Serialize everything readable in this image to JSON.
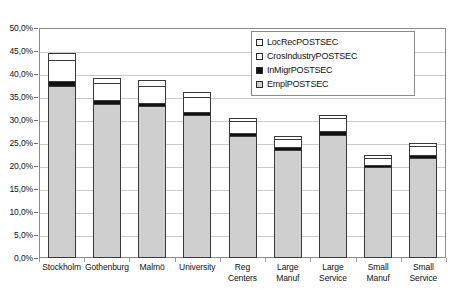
{
  "chart_data": {
    "type": "bar",
    "title": "",
    "subtitle": "",
    "xlabel": "",
    "ylabel": "",
    "stacked": true,
    "grid": true,
    "legend_position": "top-right",
    "ylim": [
      0,
      50
    ],
    "ytick_labels": [
      "50,0%",
      "45,0%",
      "40,0%",
      "35,0%",
      "30,0%",
      "25,0%",
      "20,0%",
      "15,0%",
      "10,0%",
      "5,0%",
      "0,0%"
    ],
    "ytick_values": [
      50,
      45,
      40,
      35,
      30,
      25,
      20,
      15,
      10,
      5,
      0
    ],
    "categories": [
      "Stockholm",
      "Gothenburg",
      "Malmö",
      "University",
      "Reg Centers",
      "Large Manuf",
      "Large Service",
      "Small Manuf",
      "Small Service"
    ],
    "series": [
      {
        "name": "EmplPOSTSEC",
        "color": "#cfcfcf",
        "values": [
          37.5,
          33.5,
          33.0,
          31.0,
          26.5,
          23.5,
          26.8,
          19.7,
          21.8
        ]
      },
      {
        "name": "InMigrPOSTSEC",
        "color": "#111111",
        "values": [
          1.0,
          0.8,
          0.7,
          0.8,
          0.7,
          0.6,
          0.8,
          0.5,
          0.6
        ]
      },
      {
        "name": "CrosIndustryPOSTSEC",
        "color": "#ffffff",
        "values": [
          4.5,
          3.7,
          3.8,
          3.2,
          2.5,
          1.8,
          2.8,
          1.6,
          2.0
        ]
      },
      {
        "name": "LocRecPOSTSEC",
        "color": "#ffffff",
        "values": [
          1.5,
          1.2,
          1.2,
          1.0,
          0.8,
          0.6,
          0.8,
          0.5,
          0.6
        ]
      }
    ],
    "totals": [
      44.5,
      39.2,
      38.7,
      36.0,
      30.5,
      26.5,
      31.2,
      22.3,
      25.0
    ]
  },
  "legend": {
    "items": [
      {
        "label": "LocRecPOSTSEC",
        "swatch": "white-square-icon"
      },
      {
        "label": "CrosIndustryPOSTSEC",
        "swatch": "white-square-icon"
      },
      {
        "label": "InMigrPOSTSEC",
        "swatch": "black-square-icon"
      },
      {
        "label": "EmplPOSTSEC",
        "swatch": "speckled-square-icon"
      }
    ]
  },
  "axis": {
    "y_labels": [
      "50,0%",
      "45,0%",
      "40,0%",
      "35,0%",
      "30,0%",
      "25,0%",
      "20,0%",
      "15,0%",
      "10,0%",
      "5,0%",
      "0,0%"
    ],
    "x_labels": [
      {
        "line1": "Stockholm",
        "line2": ""
      },
      {
        "line1": "Gothenburg",
        "line2": ""
      },
      {
        "line1": "Malmö",
        "line2": ""
      },
      {
        "line1": "University",
        "line2": ""
      },
      {
        "line1": "Reg",
        "line2": "Centers"
      },
      {
        "line1": "Large",
        "line2": "Manuf"
      },
      {
        "line1": "Large",
        "line2": "Service"
      },
      {
        "line1": "Small",
        "line2": "Manuf"
      },
      {
        "line1": "Small",
        "line2": "Service"
      }
    ]
  }
}
